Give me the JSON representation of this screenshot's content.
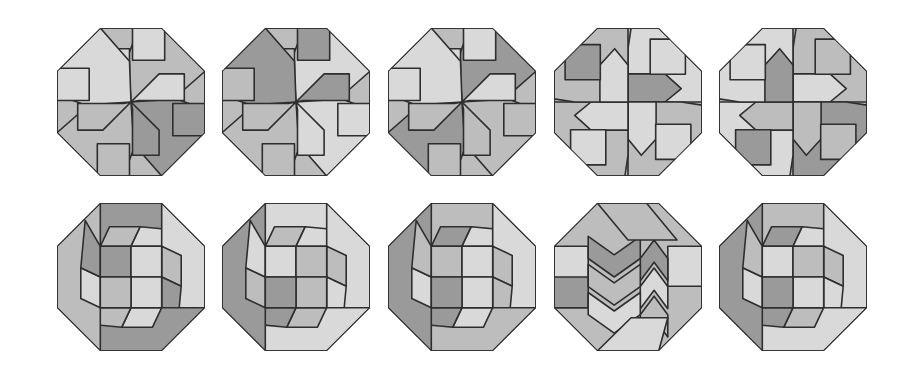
{
  "figure": {
    "rows": 2,
    "columns": 5,
    "palette": {
      "light": "#d9d9d9",
      "medium": "#bdbdbd",
      "dark": "#9a9a9a",
      "stroke": "#2e2e2e",
      "background": "#ffffff"
    },
    "octagons": [
      {
        "id": 1,
        "row": 0,
        "col": 0,
        "cx": 131,
        "cy": 102,
        "center": "pinwheel",
        "shades": [
          "medium",
          "light",
          "dark",
          "light",
          "medium",
          "dark",
          "light",
          "medium"
        ]
      },
      {
        "id": 2,
        "row": 0,
        "col": 1,
        "cx": 296,
        "cy": 102,
        "center": "pinwheel",
        "shades": [
          "light",
          "medium",
          "light",
          "dark",
          "medium",
          "light",
          "dark",
          "medium"
        ]
      },
      {
        "id": 3,
        "row": 0,
        "col": 2,
        "cx": 462,
        "cy": 102,
        "center": "pinwheel",
        "shades": [
          "dark",
          "light",
          "medium",
          "light",
          "dark",
          "medium",
          "light",
          "medium"
        ]
      },
      {
        "id": 4,
        "row": 0,
        "col": 3,
        "cx": 628,
        "cy": 102,
        "center": "cross",
        "shades": [
          "light",
          "dark",
          "medium",
          "light",
          "medium",
          "light",
          "medium",
          "light"
        ]
      },
      {
        "id": 5,
        "row": 0,
        "col": 4,
        "cx": 793,
        "cy": 102,
        "center": "cross",
        "shades": [
          "medium",
          "light",
          "dark",
          "medium",
          "light",
          "medium",
          "light",
          "dark"
        ]
      },
      {
        "id": 6,
        "row": 1,
        "col": 0,
        "cx": 131,
        "cy": 277,
        "center": "square-2x2",
        "shades": [
          "dark",
          "light",
          "medium",
          "light",
          "dark",
          "medium",
          "light",
          "medium"
        ]
      },
      {
        "id": 7,
        "row": 1,
        "col": 1,
        "cx": 296,
        "cy": 277,
        "center": "square-2x2",
        "shades": [
          "light",
          "medium",
          "dark",
          "medium",
          "light",
          "medium",
          "light",
          "medium"
        ]
      },
      {
        "id": 8,
        "row": 1,
        "col": 2,
        "cx": 462,
        "cy": 277,
        "center": "square-2x2",
        "shades": [
          "medium",
          "light",
          "dark",
          "light",
          "medium",
          "dark",
          "light",
          "medium"
        ]
      },
      {
        "id": 9,
        "row": 1,
        "col": 3,
        "cx": 628,
        "cy": 277,
        "center": "chevron",
        "shades": [
          "medium",
          "light",
          "dark",
          "medium",
          "light",
          "dark",
          "light",
          "medium"
        ]
      },
      {
        "id": 10,
        "row": 1,
        "col": 4,
        "cx": 793,
        "cy": 277,
        "center": "square-2x2",
        "shades": [
          "light",
          "medium",
          "dark",
          "light",
          "medium",
          "dark",
          "light",
          "medium"
        ]
      }
    ]
  }
}
